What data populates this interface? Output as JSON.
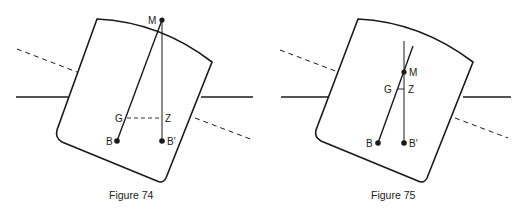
{
  "figures": [
    {
      "caption": "Figure 74",
      "labels": {
        "M": "M",
        "G": "G",
        "Z": "Z",
        "B": "B",
        "B_prime": "B′"
      }
    },
    {
      "caption": "Figure 75",
      "labels": {
        "M": "M",
        "G": "G",
        "Z": "Z",
        "B": "B",
        "B_prime": "B′"
      }
    }
  ],
  "colors": {
    "ink": "#1a1a1a",
    "background": "#ffffff"
  }
}
